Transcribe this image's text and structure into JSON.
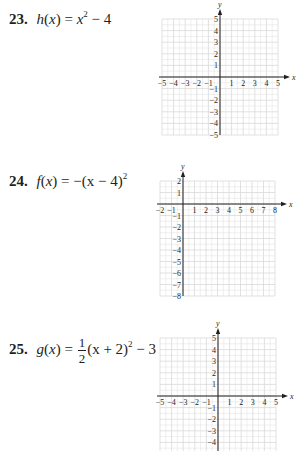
{
  "problems": [
    {
      "number": "23.",
      "func": "h",
      "arg": "x",
      "equals": "=",
      "parts": {
        "lhs_tail": "x",
        "exp": "2",
        "rest": " − 4"
      },
      "latex": "h(x) = x^2 - 4",
      "graph": {
        "x_range": [
          -5,
          5
        ],
        "y_range": [
          -5,
          5
        ],
        "x_ticks": [
          "−5",
          "−4",
          "−3",
          "−2",
          "−1",
          "1",
          "2",
          "3",
          "4",
          "5"
        ],
        "y_ticks": [
          "5",
          "4",
          "3",
          "2",
          "1",
          "−1",
          "−2",
          "−3",
          "−4",
          "−5"
        ],
        "x_axis_label": "x",
        "y_axis_label": "y"
      }
    },
    {
      "number": "24.",
      "func": "f",
      "arg": "x",
      "equals": "=",
      "parts": {
        "lead": "−(x − 4)",
        "exp": "2"
      },
      "latex": "f(x) = -(x - 4)^2",
      "graph": {
        "x_range": [
          -2,
          8
        ],
        "y_range": [
          -8,
          2
        ],
        "x_ticks": [
          "−2",
          "−1",
          "1",
          "2",
          "3",
          "4",
          "5",
          "6",
          "7",
          "8"
        ],
        "y_ticks": [
          "2",
          "1",
          "−1",
          "−2",
          "−3",
          "−4",
          "−5",
          "−6",
          "−7",
          "−8"
        ],
        "x_axis_label": "x",
        "y_axis_label": "y"
      }
    },
    {
      "number": "25.",
      "func": "g",
      "arg": "x",
      "equals": "=",
      "parts": {
        "frac_num": "1",
        "frac_den": "2",
        "mid": "(x + 2)",
        "exp": "2",
        "rest": " − 3"
      },
      "latex": "g(x) = \\frac{1}{2}(x + 2)^2 - 3",
      "graph": {
        "x_range": [
          -5,
          5
        ],
        "y_range": [
          -5,
          5
        ],
        "visible_y_min": -4,
        "x_ticks": [
          "−5",
          "−4",
          "−3",
          "−2",
          "−1",
          "1",
          "2",
          "3",
          "4",
          "5"
        ],
        "y_ticks": [
          "5",
          "4",
          "3",
          "2",
          "1",
          "−1",
          "−2",
          "−3",
          "−4"
        ],
        "x_axis_label": "x",
        "y_axis_label": "y"
      }
    }
  ],
  "style": {
    "grid_color": "#d9d9d9",
    "axis_color": "#231f20",
    "text_color": "#231f20"
  }
}
